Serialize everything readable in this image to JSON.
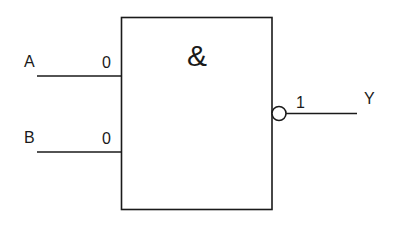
{
  "diagram": {
    "type": "logic-gate",
    "gate": {
      "symbol": "&",
      "name": "NAND",
      "negated_output": true
    },
    "inputs": [
      {
        "label": "A",
        "value": "0"
      },
      {
        "label": "B",
        "value": "0"
      }
    ],
    "output": {
      "label": "Y",
      "value": "1"
    },
    "colors": {
      "stroke": "#1a1a1a",
      "background": "#ffffff"
    }
  }
}
